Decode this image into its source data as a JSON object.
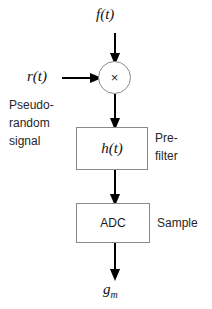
{
  "diagram": {
    "input_label": "f(t)",
    "reference_label": "r(t)",
    "reference_note_line1": "Pseudo-",
    "reference_note_line2": "random",
    "reference_note_line3": "signal",
    "multiplier_symbol": "×",
    "prefilter_block_label": "h(t)",
    "prefilter_note_line1": "Pre-",
    "prefilter_note_line2": "filter",
    "adc_block_label": "ADC",
    "adc_note": "Sample",
    "output_label_base": "g",
    "output_label_sub": "m"
  },
  "colors": {
    "box_stroke": "#8a8a8a",
    "circle_stroke": "#8a8a8a",
    "arrow": "#000000",
    "text": "#1a1a1a",
    "background": "#ffffff"
  }
}
